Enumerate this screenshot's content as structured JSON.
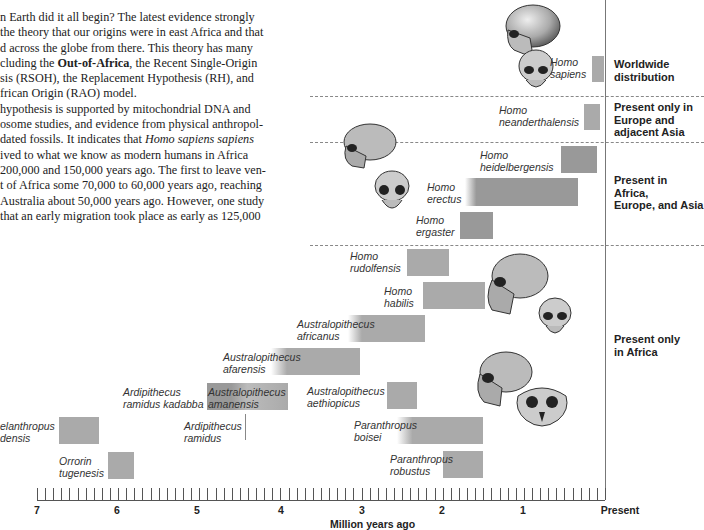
{
  "text": {
    "lines": [
      "n Earth did it all begin? The latest evidence strongly",
      "the theory that our origins were in east Africa and that",
      "d across the globe from there. This theory has many",
      "cluding the |Out-of-Africa|, the Recent Single-Origin",
      "sis (RSOH), the Replacement Hypothesis (RH), and",
      "frican Origin (RAO) model.",
      "hypothesis is supported by mitochondrial DNA and",
      "osome studies, and evidence from physical anthropol-",
      " dated fossils. It indicates that |Homo sapiens sapiens|",
      "ived to what we know as modern humans in Africa",
      "200,000 and 150,000 years ago. The first to leave ven-",
      "t of Africa some 70,000 to 60,000 years ago, reaching",
      " Australia about 50,000 years ago. However, one study",
      "that an early migration took place as early as 125,000"
    ],
    "segments": [
      {
        "t": "n Earth did it all begin? The latest evidence strongly"
      },
      {
        "t": "the theory that our origins were in east Africa and that"
      },
      {
        "t": "d across the globe from there. This theory has many"
      },
      {
        "pre": "cluding the ",
        "bold": "Out-of-Africa",
        "post": ", the Recent Single-Origin"
      },
      {
        "t": "sis (RSOH), the Replacement Hypothesis (RH), and"
      },
      {
        "t": "frican Origin (RAO) model."
      },
      {
        "t": "hypothesis is supported by mitochondrial DNA and"
      },
      {
        "t": "osome studies, and evidence from physical anthropol-"
      },
      {
        "pre": " dated fossils. It indicates that ",
        "italic": "Homo sapiens sapiens",
        "post": ""
      },
      {
        "t": "ived to what we know as modern humans in Africa"
      },
      {
        "t": "200,000 and 150,000 years ago. The first to leave ven-"
      },
      {
        "t": "t of Africa some 70,000 to 60,000 years ago, reaching"
      },
      {
        "t": " Australia about 50,000 years ago. However, one study"
      },
      {
        "t": "that an early migration took place as early as 125,000"
      }
    ]
  },
  "regions": [
    {
      "id": "worldwide",
      "lines": [
        "Worldwide",
        "distribution"
      ]
    },
    {
      "id": "europe-asia",
      "lines": [
        "Present only in",
        "Europe and",
        "adjacent Asia"
      ]
    },
    {
      "id": "africa-europe-asia",
      "lines": [
        "Present in Africa,",
        "Europe, and Asia"
      ]
    },
    {
      "id": "africa-only",
      "lines": [
        "Present only",
        "in Africa"
      ]
    }
  ],
  "axis": {
    "title": "Million years ago",
    "ticks": [
      "7",
      "6",
      "5",
      "4",
      "3",
      "2",
      "1",
      "Present"
    ]
  },
  "species": [
    {
      "id": "homo-sapiens",
      "l1": "Homo",
      "l2": "sapiens"
    },
    {
      "id": "homo-neanderthalensis",
      "l1": "Homo",
      "l2": "neanderthalensis"
    },
    {
      "id": "homo-heidelbergensis",
      "l1": "Homo",
      "l2": "heidelbergensis"
    },
    {
      "id": "homo-erectus",
      "l1": "Homo",
      "l2": "erectus"
    },
    {
      "id": "homo-ergaster",
      "l1": "Homo",
      "l2": "ergaster"
    },
    {
      "id": "homo-rudolfensis",
      "l1": "Homo",
      "l2": "rudolfensis"
    },
    {
      "id": "homo-habilis",
      "l1": "Homo",
      "l2": "habilis"
    },
    {
      "id": "australopithecus-africanus",
      "l1": "Australopithecus",
      "l2": "africanus"
    },
    {
      "id": "australopithecus-afarensis",
      "l1": "Australopithecus",
      "l2": "afarensis"
    },
    {
      "id": "ardipithecus-ramidus-kadabba",
      "l1": "Ardipithecus",
      "l2": "ramidus kadabba"
    },
    {
      "id": "australopithecus-amanensis",
      "l1": "Australopithecus",
      "l2": "amanensis"
    },
    {
      "id": "australopithecus-aethiopicus",
      "l1": "Australopithecus",
      "l2": "aethiopicus"
    },
    {
      "id": "sahelanthropus-tchadensis",
      "l1": "elanthropus",
      "l2": "densis"
    },
    {
      "id": "ardipithecus-ramidus",
      "l1": "Ardipithecus",
      "l2": "ramidus"
    },
    {
      "id": "paranthropus-boisei",
      "l1": "Paranthropus",
      "l2": "boisei"
    },
    {
      "id": "orrorin-tugenesis",
      "l1": "Orrorin",
      "l2": "tugenesis"
    },
    {
      "id": "paranthropus-robustus",
      "l1": "Paranthropus",
      "l2": "robustus"
    }
  ],
  "chart_data": {
    "type": "bar",
    "orientation": "horizontal-range",
    "title": "",
    "xlabel": "Million years ago",
    "ylabel": "",
    "xlim": [
      7,
      0
    ],
    "x_ticks": [
      "7",
      "6",
      "5",
      "4",
      "3",
      "2",
      "1",
      "Present"
    ],
    "series": [
      {
        "name": "Homo sapiens",
        "start_mya": 0.2,
        "end_mya": 0.0,
        "region": "Worldwide distribution"
      },
      {
        "name": "Homo neanderthalensis",
        "start_mya": 0.23,
        "end_mya": 0.03,
        "region": "Present only in Europe and adjacent Asia"
      },
      {
        "name": "Homo heidelbergensis",
        "start_mya": 0.6,
        "end_mya": 0.1,
        "region": "Present in Africa, Europe, and Asia"
      },
      {
        "name": "Homo erectus",
        "start_mya": 1.8,
        "end_mya": 0.3,
        "region": "Present in Africa, Europe, and Asia"
      },
      {
        "name": "Homo ergaster",
        "start_mya": 1.9,
        "end_mya": 1.4,
        "region": "Present in Africa, Europe, and Asia"
      },
      {
        "name": "Homo rudolfensis",
        "start_mya": 2.4,
        "end_mya": 1.9,
        "region": "Present only in Africa"
      },
      {
        "name": "Homo habilis",
        "start_mya": 2.3,
        "end_mya": 1.5,
        "region": "Present only in Africa"
      },
      {
        "name": "Australopithecus africanus",
        "start_mya": 3.0,
        "end_mya": 2.2,
        "region": "Present only in Africa"
      },
      {
        "name": "Australopithecus afarensis",
        "start_mya": 3.9,
        "end_mya": 3.0,
        "region": "Present only in Africa"
      },
      {
        "name": "Ardipithecus ramidus kadabba",
        "start_mya": 5.8,
        "end_mya": 5.2,
        "region": "Present only in Africa"
      },
      {
        "name": "Australopithecus amanensis",
        "start_mya": 4.8,
        "end_mya": 3.9,
        "region": "Present only in Africa"
      },
      {
        "name": "Australopithecus aethiopicus",
        "start_mya": 2.7,
        "end_mya": 2.3,
        "region": "Present only in Africa"
      },
      {
        "name": "Sahelanthropus tchadensis",
        "start_mya": 7.0,
        "end_mya": 6.2,
        "region": "Present only in Africa"
      },
      {
        "name": "Ardipithecus ramidus",
        "start_mya": 4.4,
        "end_mya": 4.4,
        "region": "Present only in Africa"
      },
      {
        "name": "Paranthropus boisei",
        "start_mya": 2.6,
        "end_mya": 1.4,
        "region": "Present only in Africa"
      },
      {
        "name": "Orrorin tugenesis",
        "start_mya": 6.0,
        "end_mya": 5.7,
        "region": "Present only in Africa"
      },
      {
        "name": "Paranthropus robustus",
        "start_mya": 2.0,
        "end_mya": 1.4,
        "region": "Present only in Africa"
      }
    ],
    "legend": []
  }
}
